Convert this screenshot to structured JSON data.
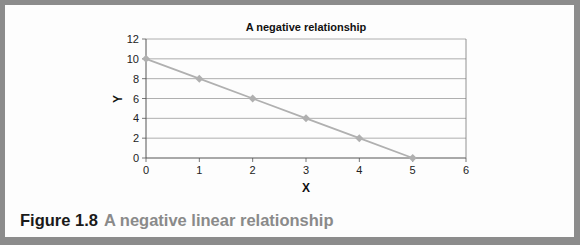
{
  "chart_data": {
    "type": "line",
    "title": "A negative relationship",
    "xlabel": "X",
    "ylabel": "Y",
    "x": [
      0,
      1,
      2,
      3,
      4,
      5
    ],
    "series": [
      {
        "name": "Series 1",
        "values": [
          10,
          8,
          6,
          4,
          2,
          0
        ],
        "color": "#b0b0b0",
        "marker": "diamond"
      }
    ],
    "xlim": [
      0,
      6
    ],
    "ylim": [
      0,
      12
    ],
    "xticks": [
      0,
      1,
      2,
      3,
      4,
      5,
      6
    ],
    "yticks": [
      0,
      2,
      4,
      6,
      8,
      10,
      12
    ],
    "grid": {
      "horizontal": true,
      "vertical": false
    },
    "legend": "none"
  },
  "caption": {
    "number": "Figure 1.8",
    "text": "A negative linear relationship"
  },
  "colors": {
    "frame": "#8c8c8c",
    "line": "#b0b0b0",
    "grid": "#9a9a9a",
    "caption_number": "#1a1a1a",
    "caption_text": "#8a8a8a"
  }
}
